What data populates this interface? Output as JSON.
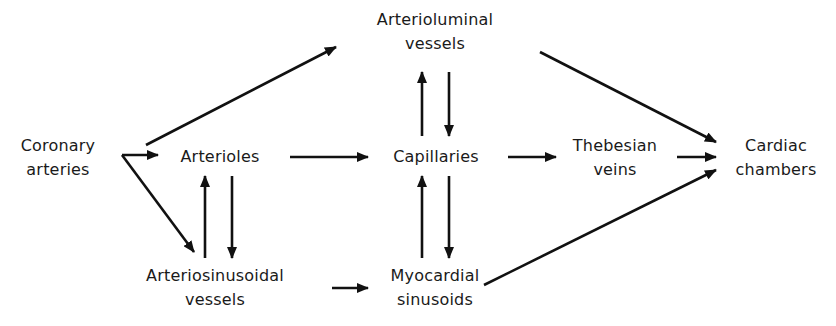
{
  "diagram": {
    "nodes": {
      "coronary_arteries": {
        "line1": "Coronary",
        "line2": "arteries"
      },
      "arterioles": {
        "line1": "Arterioles"
      },
      "arterioluminal_vessels": {
        "line1": "Arterioluminal",
        "line2": "vessels"
      },
      "capillaries": {
        "line1": "Capillaries"
      },
      "thebesian_veins": {
        "line1": "Thebesian",
        "line2": "veins"
      },
      "cardiac_chambers": {
        "line1": "Cardiac",
        "line2": "chambers"
      },
      "arteriosinusoidal_vessels": {
        "line1": "Arteriosinusoidal",
        "line2": "vessels"
      },
      "myocardial_sinusoids": {
        "line1": "Myocardial",
        "line2": "sinusoids"
      }
    },
    "edges": [
      {
        "from": "coronary_arteries",
        "to": "arterioluminal_vessels"
      },
      {
        "from": "coronary_arteries",
        "to": "arterioles"
      },
      {
        "from": "coronary_arteries",
        "to": "arteriosinusoidal_vessels"
      },
      {
        "from": "arterioles",
        "to": "capillaries"
      },
      {
        "from": "arterioles",
        "to": "arteriosinusoidal_vessels"
      },
      {
        "from": "arteriosinusoidal_vessels",
        "to": "arterioles"
      },
      {
        "from": "arteriosinusoidal_vessels",
        "to": "myocardial_sinusoids"
      },
      {
        "from": "capillaries",
        "to": "arterioluminal_vessels"
      },
      {
        "from": "arterioluminal_vessels",
        "to": "capillaries"
      },
      {
        "from": "capillaries",
        "to": "myocardial_sinusoids"
      },
      {
        "from": "myocardial_sinusoids",
        "to": "capillaries"
      },
      {
        "from": "capillaries",
        "to": "thebesian_veins"
      },
      {
        "from": "arterioluminal_vessels",
        "to": "cardiac_chambers"
      },
      {
        "from": "thebesian_veins",
        "to": "cardiac_chambers"
      },
      {
        "from": "myocardial_sinusoids",
        "to": "cardiac_chambers"
      }
    ]
  }
}
